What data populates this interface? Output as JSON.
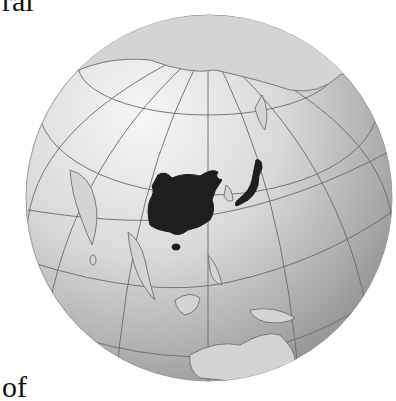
{
  "text_fragments": {
    "top": "ral",
    "bottom": "of"
  },
  "map": {
    "projection": "orthographic",
    "highlighted_regions": [
      "China (core region)",
      "Japan"
    ],
    "colors": {
      "ocean_light": "#f2f2f2",
      "ocean_dark": "#8e8e8e",
      "land": "#d4d4d4",
      "coast": "#6e6e6e",
      "graticule": "#6a6a6a",
      "highlight": "#1e1e1e"
    }
  }
}
